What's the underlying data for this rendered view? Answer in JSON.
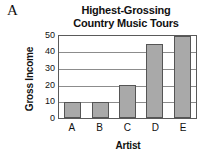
{
  "panel": {
    "label": "A"
  },
  "chart_data": {
    "type": "bar",
    "title": "Highest-Grossing Country Music Tours",
    "title_lines": [
      "Highest-Grossing",
      "Country Music Tours"
    ],
    "xlabel": "Artist",
    "ylabel": "Gross Income",
    "categories": [
      "A",
      "B",
      "C",
      "D",
      "E"
    ],
    "values": [
      10,
      10,
      20,
      45,
      50
    ],
    "ylim": [
      0,
      50
    ],
    "yticks": [
      50,
      40,
      30,
      20,
      10,
      0
    ],
    "grid": "horizontal",
    "legend": "none",
    "bar_color": "#a9a9a9",
    "bar_border_color": "#555555",
    "axis_color": "#5a5a5a",
    "grid_color": "#8c8c8c",
    "text_color": "#111111"
  }
}
